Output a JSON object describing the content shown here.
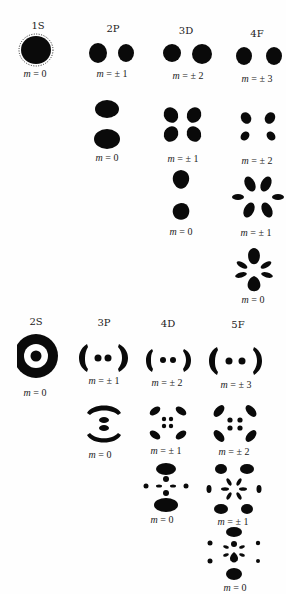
{
  "figure": {
    "ink_color": "#0a0a0a",
    "background_color": "#fefefe",
    "groups": [
      {
        "id": "top",
        "columns": [
          {
            "orbital": "1S",
            "states": [
              {
                "m_label": "m = 0",
                "m": "0"
              }
            ]
          },
          {
            "orbital": "2P",
            "states": [
              {
                "m_label": "m = ± 1",
                "m": "± 1"
              },
              {
                "m_label": "m = 0",
                "m": "0"
              }
            ]
          },
          {
            "orbital": "3D",
            "states": [
              {
                "m_label": "m = ± 2",
                "m": "± 2"
              },
              {
                "m_label": "m = ± 1",
                "m": "± 1"
              },
              {
                "m_label": "m = 0",
                "m": "0"
              }
            ]
          },
          {
            "orbital": "4F",
            "states": [
              {
                "m_label": "m = ± 3",
                "m": "± 3"
              },
              {
                "m_label": "m = ± 2",
                "m": "± 2"
              },
              {
                "m_label": "m = ± 1",
                "m": "± 1"
              },
              {
                "m_label": "m = 0",
                "m": "0"
              }
            ]
          }
        ]
      },
      {
        "id": "bottom",
        "columns": [
          {
            "orbital": "2S",
            "states": [
              {
                "m_label": "m = 0",
                "m": "0"
              }
            ]
          },
          {
            "orbital": "3P",
            "states": [
              {
                "m_label": "m = ± 1",
                "m": "± 1"
              },
              {
                "m_label": "m = 0",
                "m": "0"
              }
            ]
          },
          {
            "orbital": "4D",
            "states": [
              {
                "m_label": "m = ± 2",
                "m": "± 2"
              },
              {
                "m_label": "m = ± 1",
                "m": "± 1"
              },
              {
                "m_label": "m = 0",
                "m": "0"
              }
            ]
          },
          {
            "orbital": "5F",
            "states": [
              {
                "m_label": "m = ± 3",
                "m": "± 3"
              },
              {
                "m_label": "m = ± 2",
                "m": "± 2"
              },
              {
                "m_label": "m = ± 1",
                "m": "± 1"
              },
              {
                "m_label": "m = 0",
                "m": "0"
              }
            ]
          }
        ]
      }
    ]
  }
}
